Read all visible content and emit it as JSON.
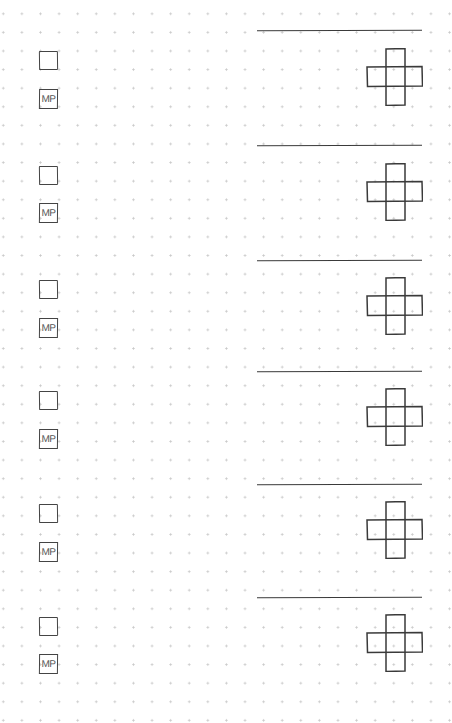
{
  "page": {
    "background": "#ffffff",
    "dot_color": "#c9c9c9",
    "ink_color": "#3a3a3a",
    "dot_spacing_px": 18.6
  },
  "entries": [
    {
      "checkbox_checked": false,
      "tag": "MP",
      "line_value": "",
      "top": 30
    },
    {
      "checkbox_checked": false,
      "tag": "MP",
      "line_value": "",
      "top": 145
    },
    {
      "checkbox_checked": false,
      "tag": "MP",
      "line_value": "",
      "top": 260
    },
    {
      "checkbox_checked": false,
      "tag": "MP",
      "line_value": "",
      "top": 371
    },
    {
      "checkbox_checked": false,
      "tag": "MP",
      "line_value": "",
      "top": 484
    },
    {
      "checkbox_checked": false,
      "tag": "MP",
      "line_value": "",
      "top": 597
    }
  ],
  "icons": {
    "checkbox": "empty-square",
    "tag_box": "mp-label-box",
    "cross": "cross-grid-5-cells"
  }
}
